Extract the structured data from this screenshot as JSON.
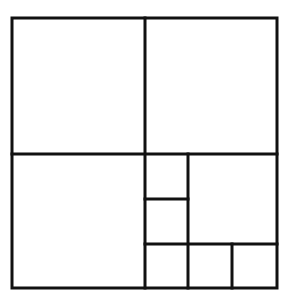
{
  "diagram": {
    "stroke_color": "#111111",
    "background": "#ffffff",
    "stroke_width": 3,
    "outer": {
      "x": 12,
      "y": 18,
      "w": 265,
      "h": 270
    },
    "lines": [
      {
        "id": "center-vertical",
        "x1": 145,
        "y1": 18,
        "x2": 145,
        "y2": 288
      },
      {
        "id": "center-horizontal",
        "x1": 12,
        "y1": 154,
        "x2": 277,
        "y2": 154
      },
      {
        "id": "small-col-vertical",
        "x1": 188,
        "y1": 154,
        "x2": 188,
        "y2": 288
      },
      {
        "id": "small-left-horizontal",
        "x1": 145,
        "y1": 199,
        "x2": 188,
        "y2": 199
      },
      {
        "id": "bottom-row-horizontal",
        "x1": 145,
        "y1": 244,
        "x2": 277,
        "y2": 244
      },
      {
        "id": "bottom-right-vertical",
        "x1": 232,
        "y1": 244,
        "x2": 232,
        "y2": 288
      }
    ]
  }
}
